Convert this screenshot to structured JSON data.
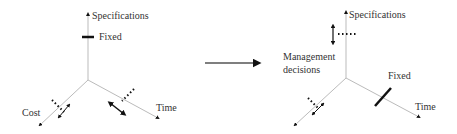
{
  "colors": {
    "axis": "#bbbbbb",
    "ink": "#111111",
    "text": "#333333",
    "background": "#ffffff"
  },
  "left_diagram": {
    "axes": {
      "vertical": "Specifications",
      "left_diagonal": "Cost",
      "right_diagonal": "Time"
    },
    "fixed_label": "Fixed",
    "fixed_axis": "Specifications"
  },
  "transition_arrow": "right-arrow",
  "right_diagram": {
    "axes": {
      "vertical": "Specifications",
      "left_diagonal": "",
      "right_diagonal": "Time"
    },
    "annotation_line1": "Management",
    "annotation_line2": "decisions",
    "fixed_label": "Fixed",
    "fixed_axis": "Time"
  }
}
